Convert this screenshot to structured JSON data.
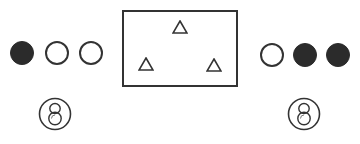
{
  "canvas": {
    "width": 360,
    "height": 144,
    "background": "#ffffff"
  },
  "colors": {
    "stroke": "#333333",
    "fill_dark": "#2b2b2b",
    "fill_light": "#ffffff"
  },
  "left_group": {
    "dots": [
      {
        "state": "filled",
        "cx": 22,
        "cy": 53,
        "r": 12
      },
      {
        "state": "open",
        "cx": 57,
        "cy": 53,
        "r": 12
      },
      {
        "state": "open",
        "cx": 91,
        "cy": 53,
        "r": 12
      }
    ],
    "badge": {
      "icon": "eight-digit-circle-icon",
      "glyph": "8",
      "cx": 55,
      "cy": 114,
      "r": 16
    }
  },
  "right_group": {
    "dots": [
      {
        "state": "open",
        "cx": 272,
        "cy": 55,
        "r": 12
      },
      {
        "state": "filled",
        "cx": 305,
        "cy": 55,
        "r": 12
      },
      {
        "state": "filled",
        "cx": 338,
        "cy": 55,
        "r": 12
      }
    ],
    "badge": {
      "icon": "eight-digit-circle-icon",
      "glyph": "8",
      "cx": 304,
      "cy": 114,
      "r": 16
    }
  },
  "board": {
    "x": 122,
    "y": 10,
    "width": 116,
    "height": 77,
    "triangles": [
      {
        "shape": "triangle-outline",
        "cx": 180,
        "top": 20,
        "size": 16
      },
      {
        "shape": "triangle-outline",
        "cx": 146,
        "top": 57,
        "size": 16
      },
      {
        "shape": "triangle-outline",
        "cx": 214,
        "top": 58,
        "size": 16
      }
    ]
  }
}
